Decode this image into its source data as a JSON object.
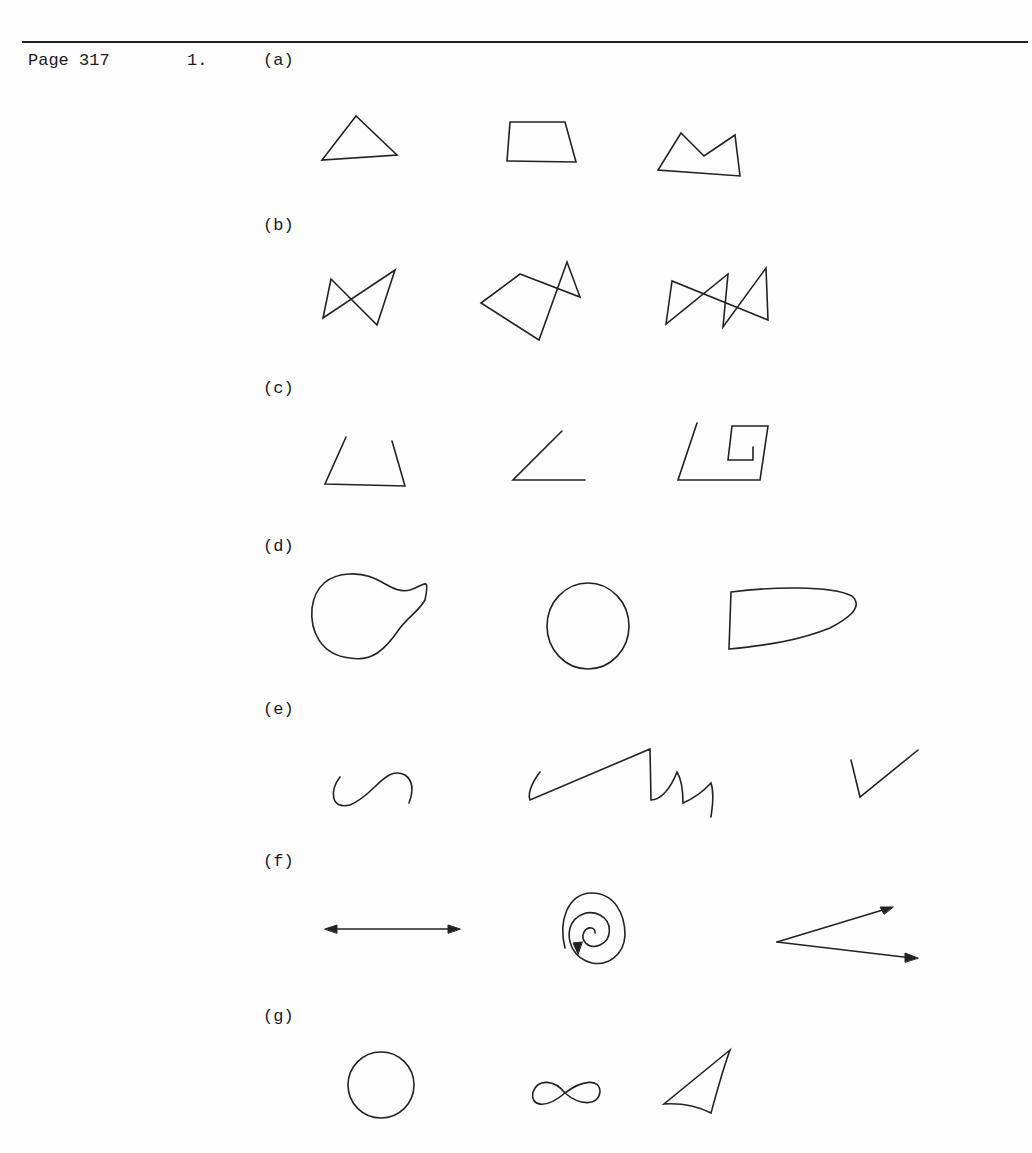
{
  "header": {
    "page_label": "Page 317",
    "problem_number": "1."
  },
  "parts": [
    {
      "label": "(a)",
      "figures": [
        "triangle",
        "trapezoid",
        "concave-pentagon"
      ]
    },
    {
      "label": "(b)",
      "figures": [
        "bowtie-quadrilateral",
        "self-intersecting-polygon",
        "double-bowtie-polygon"
      ]
    },
    {
      "label": "(c)",
      "figures": [
        "open-trapezoid-path",
        "angle-path",
        "open-spiral-polyline"
      ]
    },
    {
      "label": "(d)",
      "figures": [
        "blob-closed-curve",
        "circle",
        "d-shaped-closed-curve"
      ]
    },
    {
      "label": "(e)",
      "figures": [
        "s-curve",
        "zigzag-curve",
        "check-mark-path"
      ]
    },
    {
      "label": "(f)",
      "figures": [
        "double-arrow-line",
        "spiral-with-arrow",
        "two-rays-angle"
      ]
    },
    {
      "label": "(g)",
      "figures": [
        "circle",
        "figure-eight-curve",
        "curved-triangle"
      ]
    }
  ]
}
